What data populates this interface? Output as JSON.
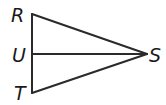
{
  "diagram": {
    "type": "geometry-triangle",
    "points": [
      {
        "name": "R",
        "x": 32,
        "y": 14,
        "label_x": 11,
        "label_y": 22
      },
      {
        "name": "U",
        "x": 32,
        "y": 54,
        "label_x": 12,
        "label_y": 62
      },
      {
        "name": "T",
        "x": 32,
        "y": 93,
        "label_x": 14,
        "label_y": 100
      },
      {
        "name": "S",
        "x": 147,
        "y": 54,
        "label_x": 149,
        "label_y": 62
      }
    ],
    "segments": [
      "RS",
      "TS",
      "RT",
      "US"
    ],
    "labels": {
      "R": "R",
      "U": "U",
      "T": "T",
      "S": "S"
    }
  }
}
